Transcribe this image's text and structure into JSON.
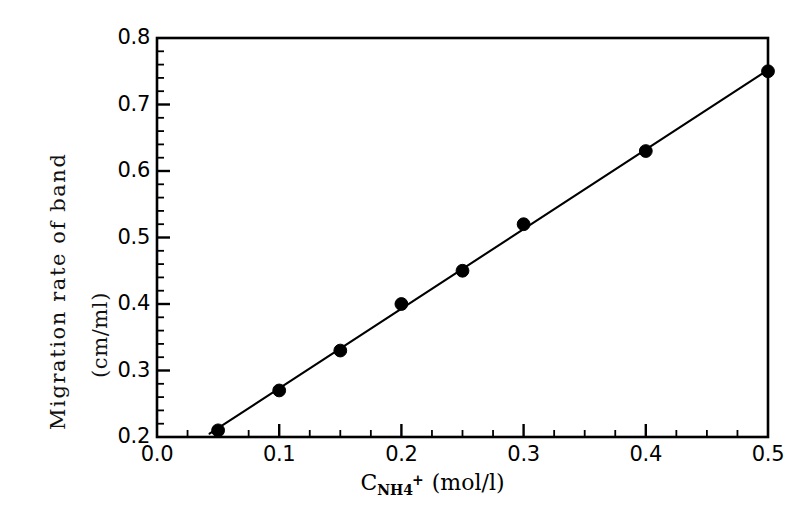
{
  "chart_data": {
    "type": "scatter",
    "title": "",
    "subtitle": "",
    "xlabel_parts": {
      "symbol": "C",
      "subscript": "NH4",
      "superscript": "+",
      "unit": "(mol/l)"
    },
    "xlabel": "C_NH4+ (mol/l)",
    "ylabel_line1": "Migration rate of band",
    "ylabel_line2": "(cm/ml)",
    "ylabel": "Migration rate of band (cm/ml)",
    "xlim": [
      0.0,
      0.5
    ],
    "ylim": [
      0.2,
      0.8
    ],
    "x_major_tick": 0.1,
    "x_minor_tick": 0.025,
    "y_major_tick": 0.1,
    "y_minor_tick": 0.02,
    "grid": false,
    "legend": null,
    "tick_direction": "in",
    "frame": "box",
    "marker": "filled-circle",
    "marker_color": "#000000",
    "line_color": "#000000",
    "x_tick_labels": [
      "0.0",
      "0.1",
      "0.2",
      "0.3",
      "0.4",
      "0.5"
    ],
    "x_tick_values": [
      0.0,
      0.1,
      0.2,
      0.3,
      0.4,
      0.5
    ],
    "y_tick_labels": [
      "0.2",
      "0.3",
      "0.4",
      "0.5",
      "0.6",
      "0.7",
      "0.8"
    ],
    "y_tick_values": [
      0.2,
      0.3,
      0.4,
      0.5,
      0.6,
      0.7,
      0.8
    ],
    "x": [
      0.05,
      0.1,
      0.15,
      0.2,
      0.25,
      0.3,
      0.4,
      0.5
    ],
    "values": [
      0.21,
      0.27,
      0.33,
      0.4,
      0.45,
      0.52,
      0.63,
      0.75
    ],
    "points": [
      {
        "x": 0.05,
        "y": 0.21
      },
      {
        "x": 0.1,
        "y": 0.27
      },
      {
        "x": 0.15,
        "y": 0.33
      },
      {
        "x": 0.2,
        "y": 0.4
      },
      {
        "x": 0.25,
        "y": 0.45
      },
      {
        "x": 0.3,
        "y": 0.52
      },
      {
        "x": 0.4,
        "y": 0.63
      },
      {
        "x": 0.5,
        "y": 0.75
      }
    ],
    "fit_line": {
      "type": "linear",
      "endpoints": [
        {
          "x": 0.043,
          "y": 0.205
        },
        {
          "x": 0.5,
          "y": 0.752
        }
      ]
    }
  }
}
